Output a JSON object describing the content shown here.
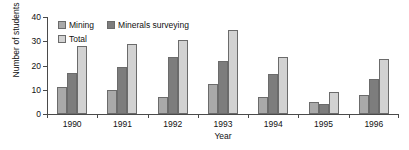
{
  "chart_data": {
    "type": "bar",
    "title": "",
    "xlabel": "Year",
    "ylabel": "Number of students",
    "categories": [
      "1990",
      "1991",
      "1992",
      "1993",
      "1994",
      "1995",
      "1996"
    ],
    "series": [
      {
        "name": "Mining",
        "color": "#a9a9a9",
        "values": [
          11,
          10,
          7,
          12.5,
          7,
          5,
          8
        ]
      },
      {
        "name": "Minerals surveying",
        "color": "#7d7d7d",
        "values": [
          17,
          19.5,
          23.5,
          22,
          16.5,
          4,
          14.5
        ]
      },
      {
        "name": "Total",
        "color": "#d2d2d2",
        "values": [
          28,
          29,
          30.5,
          34.5,
          23.5,
          9,
          22.5
        ]
      }
    ],
    "ylim": [
      0,
      40
    ],
    "yticks": [
      0,
      10,
      20,
      30,
      40
    ],
    "ytick_labels": [
      "0",
      "10",
      "20",
      "30",
      "40"
    ],
    "grid": false,
    "legend_position": "top-left"
  },
  "axes": {
    "y_title": "Number of students",
    "x_title": "Year"
  },
  "legend": {
    "items": [
      {
        "label": "Mining"
      },
      {
        "label": "Minerals surveying"
      },
      {
        "label": "Total"
      }
    ]
  }
}
